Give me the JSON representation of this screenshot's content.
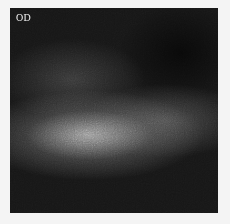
{
  "scan": {
    "eye_label": "OD"
  }
}
